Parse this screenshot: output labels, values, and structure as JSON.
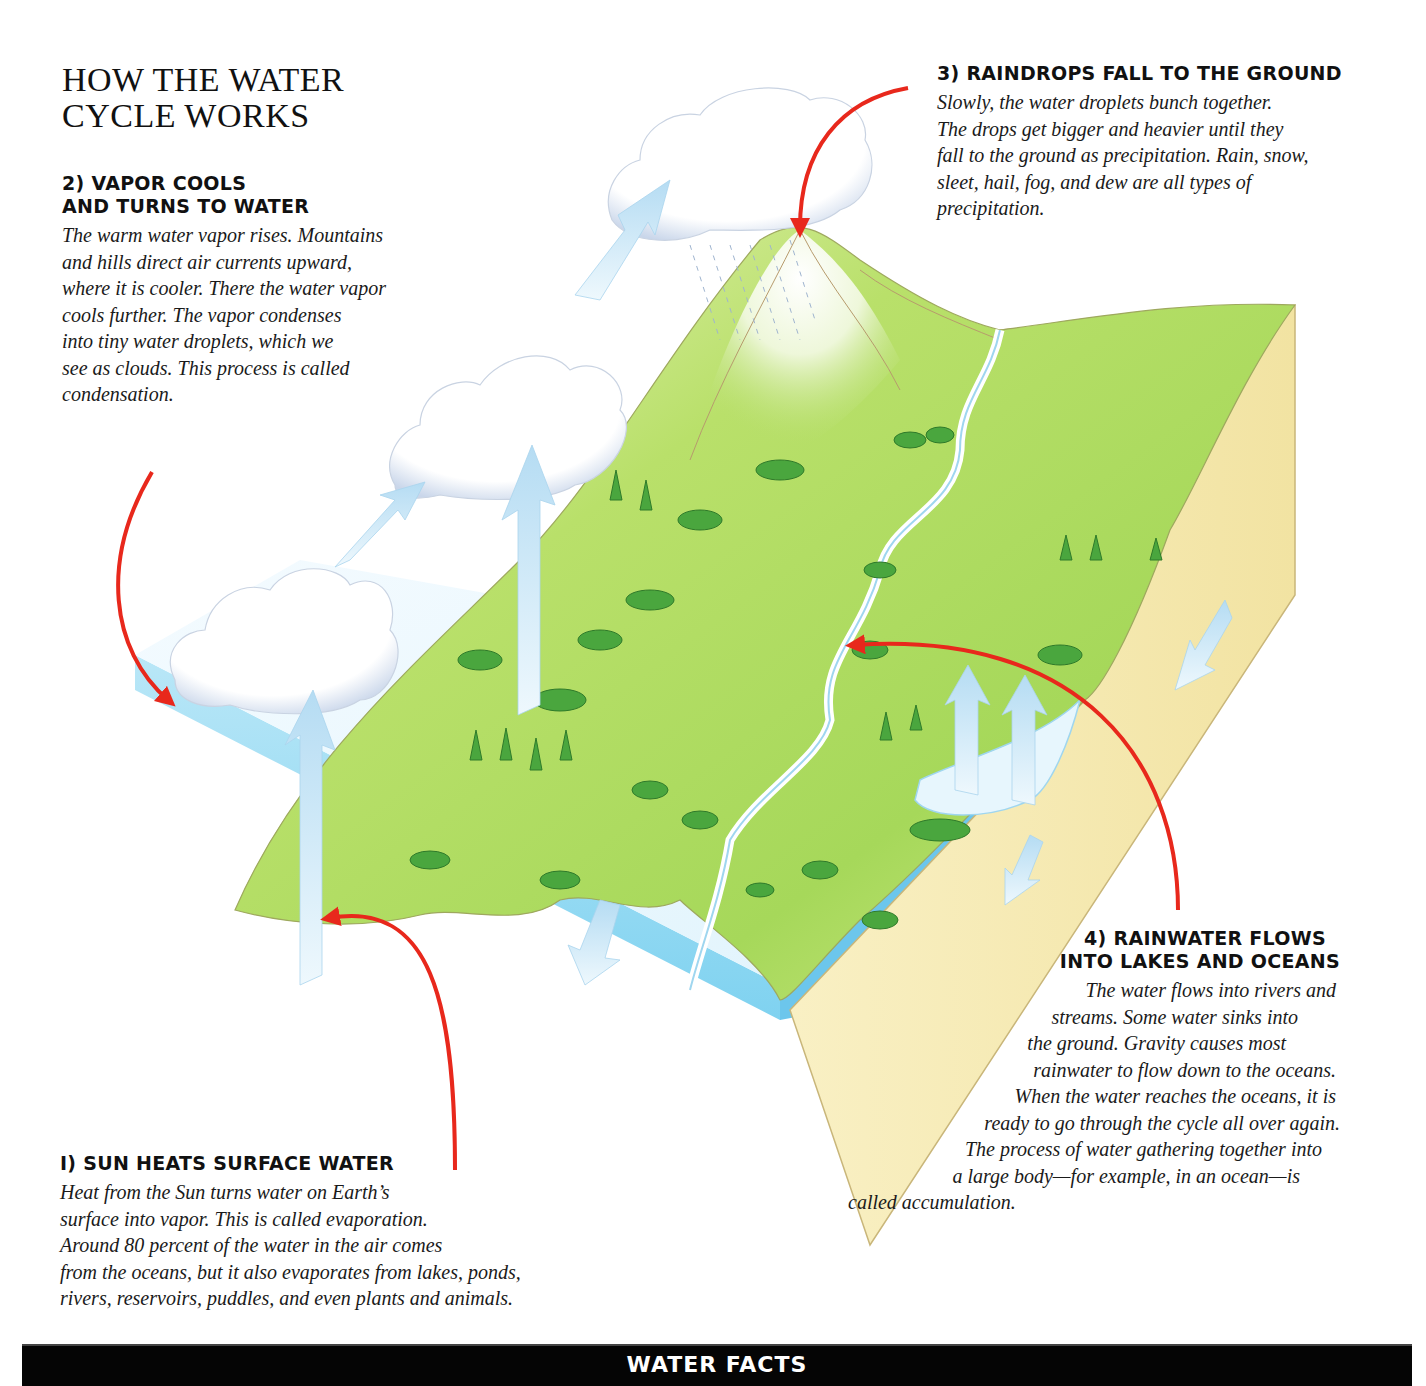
{
  "title": {
    "line1": "HOW THE WATER",
    "line2": "CYCLE WORKS"
  },
  "steps": [
    {
      "id": "step1",
      "number": 1,
      "heading_lines": [
        "I) SUN HEATS SURFACE WATER"
      ],
      "body_lines": [
        "Heat from the Sun turns water on Earth’s",
        "surface into vapor. This is called evaporation.",
        "Around 80 percent of the water in the air comes",
        "from the oceans, but it also evaporates from lakes, ponds,",
        "rivers, reservoirs, puddles, and even plants and animals."
      ]
    },
    {
      "id": "step2",
      "number": 2,
      "heading_lines": [
        "2) VAPOR COOLS",
        "AND TURNS TO WATER"
      ],
      "body_lines": [
        "The warm water vapor rises. Mountains",
        "and hills direct air currents upward,",
        "where it is cooler. There the water vapor",
        "cools further. The vapor condenses",
        "into tiny water droplets, which we",
        "see as clouds. This process is called",
        "condensation."
      ]
    },
    {
      "id": "step3",
      "number": 3,
      "heading_lines": [
        "3) RAINDROPS FALL TO THE GROUND"
      ],
      "body_lines": [
        "Slowly, the water droplets bunch together.",
        "The drops get bigger and heavier until they",
        "fall to the ground as precipitation. Rain, snow,",
        "sleet, hail, fog, and dew are all types of",
        "precipitation."
      ]
    },
    {
      "id": "step4",
      "number": 4,
      "heading_lines": [
        "4) RAINWATER FLOWS",
        "INTO LAKES AND OCEANS"
      ],
      "body_lines": [
        "The water flows into rivers and",
        "streams. Some water sinks into",
        "the ground. Gravity causes most",
        "rainwater to flow down to the oceans.",
        "When the water reaches the oceans, it is",
        "ready to go through the cycle all over again.",
        "The process of water gathering together into",
        "a large body—for example, in an ocean—is",
        "called accumulation."
      ],
      "body_indents": [
        205,
        95,
        40,
        0,
        30,
        20,
        10,
        -45,
        -100
      ]
    }
  ],
  "facts_bar": {
    "label": "WATER FACTS"
  },
  "colors": {
    "arrow_red": "#e8281c",
    "vapor_arrow": "#bfe3f6",
    "ocean_top": "#e6f6fd",
    "ocean_edge": "#7ed0ef",
    "land_light": "#d9ee8a",
    "land_mid": "#9fd356",
    "land_dark": "#5fae3a",
    "soil": "#f6ecb8",
    "tree": "#3e9a3a",
    "cloud_shadow": "#b8c7dd"
  },
  "diagram_labels": {
    "ocean": "ocean",
    "lake": "lake",
    "river": "river",
    "mountain": "mountain",
    "cloud_low": "cloud",
    "cloud_mid": "cloud",
    "cloud_high": "rain cloud"
  }
}
